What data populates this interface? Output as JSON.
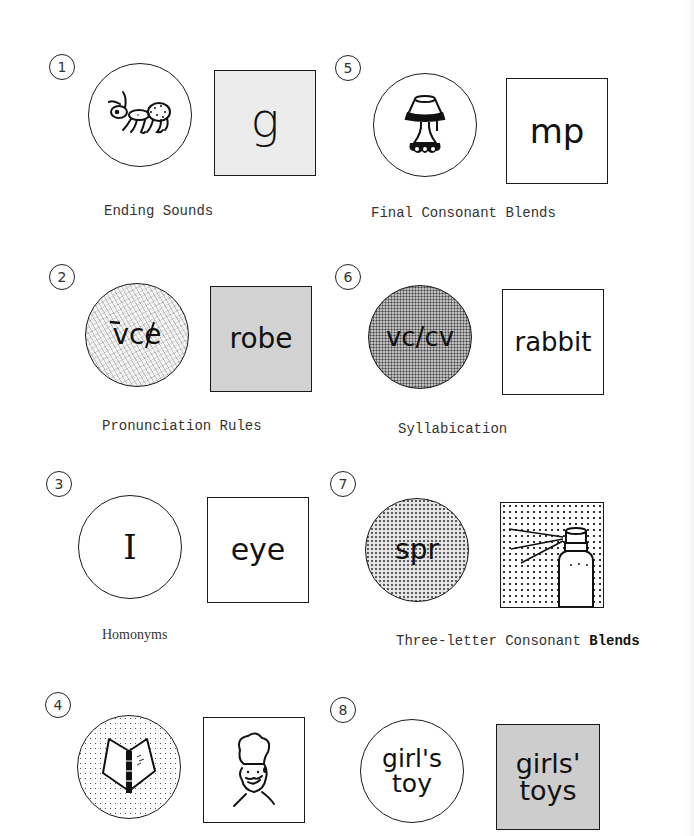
{
  "items": [
    {
      "number": "1",
      "circle_text": "",
      "circle_picture": "ant",
      "square_text": "g",
      "square_picture": "",
      "label": "Ending Sounds"
    },
    {
      "number": "2",
      "circle_text": "vce",
      "circle_mark": "long vowel macron over v, slash through e",
      "circle_picture": "",
      "square_text": "robe",
      "square_picture": "",
      "label": "Pronunciation Rules"
    },
    {
      "number": "3",
      "circle_text": "I",
      "circle_picture": "",
      "square_text": "eye",
      "square_picture": "",
      "label": "Homonyms"
    },
    {
      "number": "4",
      "circle_text": "",
      "circle_picture": "book",
      "square_text": "",
      "square_picture": "chef",
      "label": ""
    },
    {
      "number": "5",
      "circle_text": "",
      "circle_picture": "lamp",
      "square_text": "mp",
      "square_picture": "",
      "label": "Final Consonant Blends"
    },
    {
      "number": "6",
      "circle_text": "vc/cv",
      "circle_picture": "",
      "square_text": "rabbit",
      "square_picture": "",
      "label": "Syllabication"
    },
    {
      "number": "7",
      "circle_text": "spr",
      "circle_picture": "",
      "square_text": "",
      "square_picture": "spray-can",
      "label_main": "Three-letter Consonant ",
      "label_bold": "Blends"
    },
    {
      "number": "8",
      "circle_text_line1": "girl's",
      "circle_text_line2": "toy",
      "circle_picture": "",
      "square_text_line1": "girls'",
      "square_text_line2": "toys",
      "square_picture": "",
      "label": ""
    }
  ],
  "colors": {
    "ink": "#1a1a1a",
    "label_gray": "#333333",
    "fill_light_gray": "#ececec",
    "fill_mid_gray": "#d2d2d2",
    "background": "#ffffff"
  }
}
